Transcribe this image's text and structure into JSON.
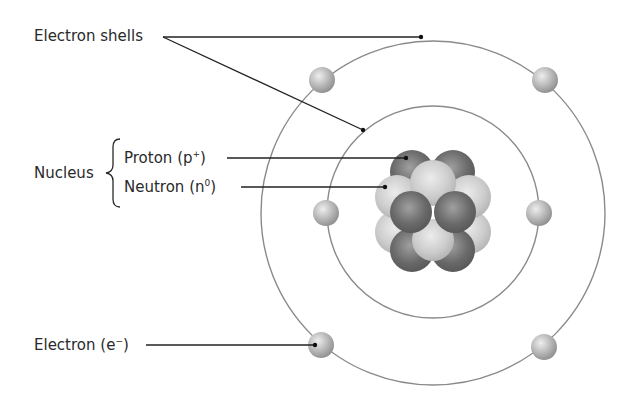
{
  "diagram": {
    "labels": {
      "electron_shells": "Electron shells",
      "nucleus": "Nucleus",
      "proton": {
        "text": "Proton (p",
        "sup": "+",
        "close": ")"
      },
      "neutron": {
        "text": "Neutron (n",
        "sup": "0",
        "close": ")"
      },
      "electron": {
        "text": "Electron (e",
        "sup": "−",
        "close": ")"
      }
    },
    "colors": {
      "line": "#222222",
      "shell": "#8a8a8a",
      "proton": "#6e6e6e",
      "neutron": "#c8c8c8",
      "electron": "#b4b4b4",
      "text": "#2a2a2a"
    },
    "counts": {
      "shells": 2,
      "electrons_inner_shell": 2,
      "electrons_outer_shell": 4
    }
  }
}
